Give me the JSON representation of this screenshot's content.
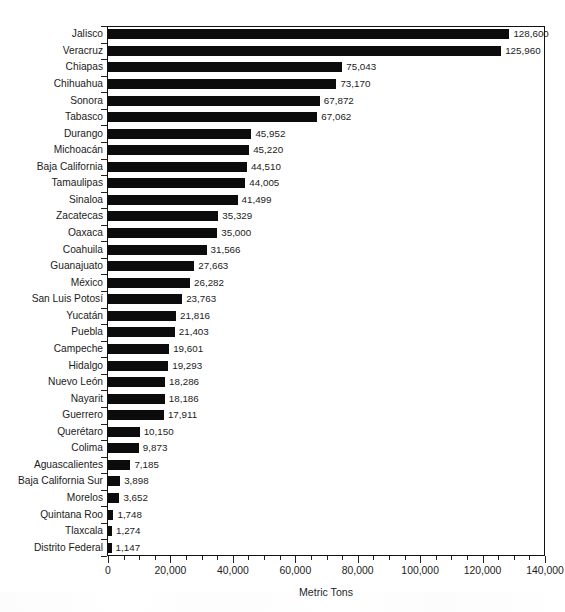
{
  "chart_data": {
    "type": "bar",
    "orientation": "horizontal",
    "title": "",
    "xlabel": "Metric Tons",
    "ylabel": "",
    "xlim": [
      0,
      140000
    ],
    "xticks": [
      0,
      20000,
      40000,
      60000,
      80000,
      100000,
      120000,
      140000
    ],
    "xticklabels": [
      "0",
      "20,000",
      "40,000",
      "60,000",
      "80,000",
      "100,000",
      "120,000",
      "140,000"
    ],
    "minor_tick_interval": 5000,
    "grid": false,
    "legend": null,
    "bar_color": "#0c0c0c",
    "categories": [
      "Jalisco",
      "Veracruz",
      "Chiapas",
      "Chihuahua",
      "Sonora",
      "Tabasco",
      "Durango",
      "Michoacán",
      "Baja California",
      "Tamaulipas",
      "Sinaloa",
      "Zacatecas",
      "Oaxaca",
      "Coahuila",
      "Guanajuato",
      "México",
      "San Luis Potosí",
      "Yucatán",
      "Puebla",
      "Campeche",
      "Hidalgo",
      "Nuevo León",
      "Nayarit",
      "Guerrero",
      "Querétaro",
      "Colima",
      "Aguascalientes",
      "Baja California Sur",
      "Morelos",
      "Quintana Roo",
      "Tlaxcala",
      "Distrito Federal"
    ],
    "values": [
      128600,
      125960,
      75043,
      73170,
      67872,
      67062,
      45952,
      45220,
      44510,
      44005,
      41499,
      35329,
      35000,
      31566,
      27663,
      26282,
      23763,
      21816,
      21403,
      19601,
      19293,
      18286,
      18186,
      17911,
      10150,
      9873,
      7185,
      3898,
      3652,
      1748,
      1274,
      1147
    ],
    "value_labels": [
      "128,600",
      "125,960",
      "75,043",
      "73,170",
      "67,872",
      "67,062",
      "45,952",
      "45,220",
      "44,510",
      "44,005",
      "41,499",
      "35,329",
      "35,000",
      "31,566",
      "27,663",
      "26,282",
      "23,763",
      "21,816",
      "21,403",
      "19,601",
      "19,293",
      "18,286",
      "18,186",
      "17,911",
      "10,150",
      "9,873",
      "7,185",
      "3,898",
      "3,652",
      "1,748",
      "1,274",
      "1,147"
    ]
  }
}
